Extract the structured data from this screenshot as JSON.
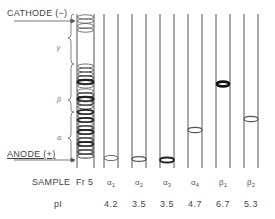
{
  "figure": {
    "cathode_label": "CATHODE (−)",
    "anode_label": "ANODE (+)",
    "sample_row_label": "SAMPLE",
    "pi_row_label": "pI",
    "bracket_labels": [
      {
        "key": "gamma",
        "symbol": "γ"
      },
      {
        "key": "beta",
        "symbol": "β"
      },
      {
        "key": "alpha",
        "symbol": "α"
      }
    ],
    "reference_sample": {
      "name": "Fr 5"
    },
    "samples": [
      {
        "base": "α",
        "sub": "1",
        "pI": "4.2"
      },
      {
        "base": "α",
        "sub": "2",
        "pI": "3.5"
      },
      {
        "base": "α",
        "sub": "3",
        "pI": "3.5"
      },
      {
        "base": "α",
        "sub": "4",
        "pI": "4.7"
      },
      {
        "base": "β",
        "sub": "1",
        "pI": "6.7"
      },
      {
        "base": "β",
        "sub": "2",
        "pI": "5.3"
      }
    ],
    "colors": {
      "line": "#555555",
      "band": "#222222",
      "text": "#444444"
    }
  }
}
